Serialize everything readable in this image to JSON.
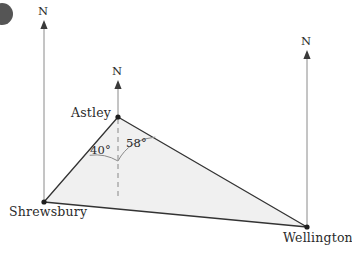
{
  "figure": {
    "type": "bearings-triangle-diagram",
    "width": 352,
    "height": 253,
    "bullet_marker": "●",
    "colors": {
      "fill": "#f0f0f0",
      "stroke": "#333333",
      "north_line": "#8a8a8a",
      "dashed": "#9a9a9a",
      "arc": "#8a8a8a",
      "text": "#2b2b2b",
      "background": "#ffffff"
    },
    "places": [
      {
        "id": "astley",
        "label": "Astley",
        "x": 118,
        "y": 117,
        "north_arrow": {
          "x": 118,
          "tip_y": 82,
          "base_y": 117,
          "label": "N"
        }
      },
      {
        "id": "shrewsbury",
        "label": "Shrewsbury",
        "x": 44,
        "y": 202,
        "north_arrow": {
          "x": 44,
          "tip_y": 22,
          "base_y": 202,
          "label": "N"
        }
      },
      {
        "id": "wellington",
        "label": "Wellington",
        "x": 307,
        "y": 227,
        "north_arrow": {
          "x": 307,
          "tip_y": 52,
          "base_y": 227,
          "label": "N"
        }
      }
    ],
    "angles": [
      {
        "id": "angle-40",
        "label": "40°",
        "value": 40,
        "vertex": "astley",
        "between": [
          "astley-shrewsbury-leg",
          "north-dashed"
        ]
      },
      {
        "id": "angle-58",
        "label": "58°",
        "value": 58,
        "vertex": "astley",
        "between": [
          "north-dashed",
          "astley-wellington-leg"
        ]
      }
    ],
    "dashed_north_at_astley": {
      "x": 118,
      "from_y": 117,
      "to_y": 200
    }
  }
}
